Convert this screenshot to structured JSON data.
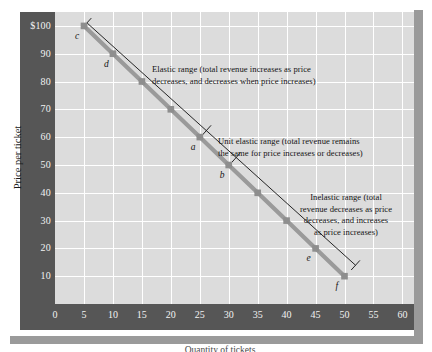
{
  "chart_data": {
    "type": "line",
    "title": "",
    "xlabel": "Quantity of tickets",
    "ylabel": "Price per ticket",
    "xlim": [
      0,
      62
    ],
    "ylim": [
      0,
      105
    ],
    "grid": true,
    "legend": "none",
    "x_ticks": [
      "0",
      "5",
      "10",
      "15",
      "20",
      "25",
      "30",
      "35",
      "40",
      "45",
      "50",
      "55",
      "60"
    ],
    "x_tick_values": [
      0,
      5,
      10,
      15,
      20,
      25,
      30,
      35,
      40,
      45,
      50,
      55,
      60
    ],
    "y_ticks": [
      "$100",
      "90",
      "80",
      "70",
      "60",
      "50",
      "40",
      "30",
      "20",
      "10"
    ],
    "y_tick_values": [
      100,
      90,
      80,
      70,
      60,
      50,
      40,
      30,
      20,
      10
    ],
    "series": [
      {
        "name": "Demand curve",
        "color": "#9a9a9a",
        "x": [
          5,
          10,
          15,
          20,
          25,
          30,
          35,
          40,
          45,
          50
        ],
        "values": [
          100,
          90,
          80,
          70,
          60,
          50,
          40,
          30,
          20,
          10
        ]
      }
    ],
    "points": [
      {
        "label": "c",
        "x": 5,
        "y": 100
      },
      {
        "label": "d",
        "x": 10,
        "y": 90
      },
      {
        "label": "",
        "x": 15,
        "y": 80
      },
      {
        "label": "",
        "x": 20,
        "y": 70
      },
      {
        "label": "a",
        "x": 25,
        "y": 60
      },
      {
        "label": "b",
        "x": 30,
        "y": 50
      },
      {
        "label": "",
        "x": 35,
        "y": 40
      },
      {
        "label": "",
        "x": 40,
        "y": 30
      },
      {
        "label": "e",
        "x": 45,
        "y": 20
      },
      {
        "label": "f",
        "x": 50,
        "y": 10
      }
    ],
    "annotations": [
      {
        "id": "elastic",
        "line1": "Elastic range (total revenue increases as price",
        "line2": "decreases, and decreases when price increases)"
      },
      {
        "id": "unit-elastic",
        "line1": "Unit elastic range (total revenue remains",
        "line2": "the same for price increases or decreases)"
      },
      {
        "id": "inelastic",
        "line1": "Inelastic range (total",
        "line2": "revenue decreases as price",
        "line3": "decreases, and increases",
        "line4": "as price increases)"
      }
    ],
    "colors": {
      "axis_band": "#565656",
      "plot_background": "#dcdcdc",
      "gridline": "#ffffff",
      "demand_line": "#9a9a9a",
      "marker": "#8e8e8e",
      "bracket_line": "#101010",
      "shadow": "#9a9a9a",
      "tick_label": "#f2f2f2",
      "annotation_text": "#141414"
    }
  }
}
